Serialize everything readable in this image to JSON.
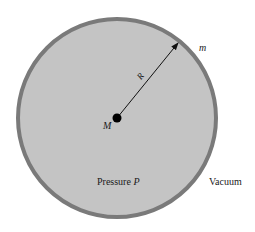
{
  "diagram": {
    "sphere": {
      "fill": "#c4c4c4",
      "border": "#7a7a7a",
      "cx": 117,
      "cy": 118,
      "r": 99
    },
    "center_mass": {
      "label": "M"
    },
    "radius": {
      "label": "R"
    },
    "surface_mass": {
      "label": "m"
    },
    "inside": {
      "text": "Pressure",
      "symbol": "P"
    },
    "outside": {
      "text": "Vacuum"
    }
  }
}
